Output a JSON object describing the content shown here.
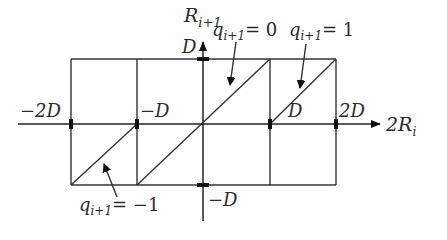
{
  "diagram": {
    "type": "quantizer-transfer-characteristic",
    "axes": {
      "x_label": "2R",
      "x_label_sub": "i",
      "y_label": "R",
      "y_label_sub": "i+1"
    },
    "tick_labels": {
      "x_neg2D": "−2D",
      "x_negD": "−D",
      "x_D": "D",
      "x_2D": "2D",
      "y_D": "D",
      "y_negD": "−D"
    },
    "annotations": [
      {
        "q": "q",
        "sub": "i+1",
        "eq": "= 0"
      },
      {
        "q": "q",
        "sub": "i+1",
        "eq": "= 1"
      },
      {
        "q": "q",
        "sub": "i+1",
        "eq": "= −1"
      }
    ],
    "colors": {
      "stroke": "#333333",
      "background": "#ffffff"
    }
  }
}
